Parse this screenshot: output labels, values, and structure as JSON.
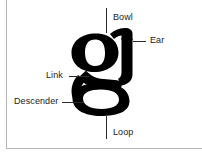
{
  "diagram": {
    "glyph": {
      "character": "g",
      "typeface_style": "serif double-storey",
      "color": "#000000"
    },
    "background_color": "#ffffff",
    "frame_color": "#b5b5b5",
    "leader_color": "#2b2b2b",
    "text_color": "#1b1b1b",
    "labels": {
      "bowl": "Bowl",
      "ear": "Ear",
      "link": "Link",
      "descender": "Descender",
      "loop": "Loop"
    }
  }
}
